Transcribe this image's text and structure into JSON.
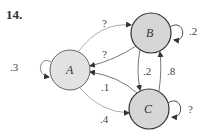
{
  "problem": {
    "number": "14."
  },
  "colors": {
    "node_fill": "#dcdcdc",
    "node_stroke": "#555555",
    "edge": "#888888",
    "text": "#444444"
  },
  "nodes": [
    {
      "id": "A",
      "label": "A",
      "cx": 70,
      "cy": 70,
      "r": 20
    },
    {
      "id": "B",
      "label": "B",
      "cx": 151,
      "cy": 33,
      "r": 20
    },
    {
      "id": "C",
      "label": "C",
      "cx": 149,
      "cy": 109,
      "r": 20
    }
  ],
  "edges": [
    {
      "from": "A",
      "to": "A",
      "label": ".3"
    },
    {
      "from": "A",
      "to": "B",
      "label": "?"
    },
    {
      "from": "B",
      "to": "A",
      "label": "?"
    },
    {
      "from": "C",
      "to": "A",
      "label": ".1"
    },
    {
      "from": "A",
      "to": "C",
      "label": ".4"
    },
    {
      "from": "B",
      "to": "C",
      "label": ".2"
    },
    {
      "from": "C",
      "to": "B",
      "label": ".8"
    },
    {
      "from": "B",
      "to": "B",
      "label": ".2"
    },
    {
      "from": "C",
      "to": "C",
      "label": "?"
    }
  ]
}
